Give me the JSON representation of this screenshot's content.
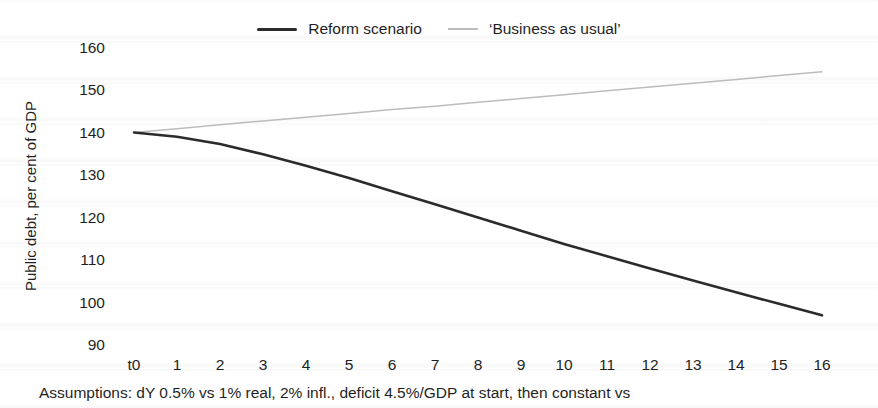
{
  "legend": {
    "reform_label": "Reform scenario",
    "bau_label": "‘Business as usual’"
  },
  "axes": {
    "y_title": "Public debt, per cent of GDP"
  },
  "footnote": "Assumptions: dY 0.5% vs 1% real, 2% infl., deficit 4.5%/GDP at start, then constant vs",
  "colors": {
    "reform_line": "#2b2b2b",
    "bau_line": "#bcbcbc",
    "text": "#1f1f1f",
    "background": "#ffffff"
  },
  "chart_data": {
    "type": "line",
    "title": "",
    "xlabel": "",
    "ylabel": "Public debt, per cent of GDP",
    "categories": [
      "t0",
      "1",
      "2",
      "3",
      "4",
      "5",
      "6",
      "7",
      "8",
      "9",
      "10",
      "11",
      "12",
      "13",
      "14",
      "15",
      "16"
    ],
    "yticks": [
      90,
      100,
      110,
      120,
      130,
      140,
      150,
      160
    ],
    "ylim": [
      90,
      160
    ],
    "grid": false,
    "legend_position": "top",
    "series": [
      {
        "name": "Reform scenario",
        "color": "#2b2b2b",
        "stroke_width": 2.6,
        "values": [
          140,
          139,
          137.3,
          134.9,
          132.2,
          129.3,
          126.2,
          123.1,
          120,
          116.9,
          113.8,
          110.9,
          108,
          105.2,
          102.4,
          99.7,
          97
        ]
      },
      {
        "name": "‘Business as usual’",
        "color": "#bcbcbc",
        "stroke_width": 1.5,
        "values": [
          140,
          140.9,
          141.8,
          142.7,
          143.6,
          144.5,
          145.4,
          146.2,
          147.1,
          148,
          148.9,
          149.8,
          150.7,
          151.6,
          152.5,
          153.4,
          154.3
        ]
      }
    ]
  }
}
